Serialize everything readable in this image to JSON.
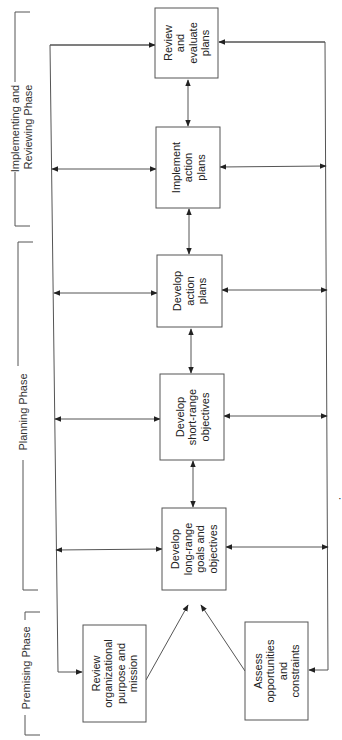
{
  "diagram": {
    "orientation": "rotated 90 degrees counter-clockwise",
    "phases": [
      {
        "id": "premising",
        "label": [
          "Premising Phase"
        ]
      },
      {
        "id": "planning",
        "label": [
          "Planning Phase"
        ]
      },
      {
        "id": "implementing",
        "label": [
          "Implementing and",
          "Reviewing Phase"
        ]
      }
    ],
    "boxes": [
      {
        "id": "review-purpose",
        "lines": [
          "Review",
          "organizational",
          "purpose and",
          "mission"
        ]
      },
      {
        "id": "assess",
        "lines": [
          "Assess",
          "opportunities",
          "and",
          "constraints"
        ]
      },
      {
        "id": "long-range",
        "lines": [
          "Develop",
          "long-range",
          "goals and",
          "objectives"
        ]
      },
      {
        "id": "short-range",
        "lines": [
          "Develop",
          "short-range",
          "objectives"
        ]
      },
      {
        "id": "action-plans",
        "lines": [
          "Develop",
          "action",
          "plans"
        ]
      },
      {
        "id": "implement",
        "lines": [
          "Implement",
          "action",
          "plans"
        ]
      },
      {
        "id": "review-evaluate",
        "lines": [
          "Review",
          "and",
          "evaluate",
          "plans"
        ]
      }
    ],
    "connections": [
      {
        "from": "review-purpose",
        "to": "long-range",
        "type": "arrow"
      },
      {
        "from": "assess",
        "to": "long-range",
        "type": "arrow"
      },
      {
        "from": "long-range",
        "to": "short-range",
        "type": "double-arrow"
      },
      {
        "from": "short-range",
        "to": "action-plans",
        "type": "double-arrow"
      },
      {
        "from": "action-plans",
        "to": "implement",
        "type": "double-arrow"
      },
      {
        "from": "implement",
        "to": "review-evaluate",
        "type": "double-arrow"
      },
      {
        "from": "feedback-bus-left",
        "to": "review-purpose",
        "type": "arrow"
      },
      {
        "from": "feedback-bus-right",
        "to": "assess",
        "type": "arrow"
      }
    ]
  }
}
